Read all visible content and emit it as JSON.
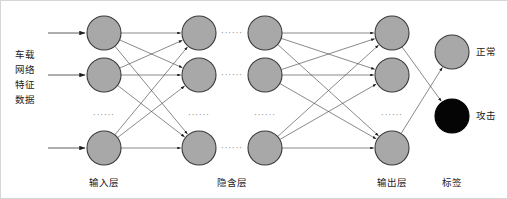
{
  "figure": {
    "type": "neural-network-architecture-diagram",
    "background_color": "#ffffff",
    "border_color": "#cfcfcf"
  },
  "side_label": {
    "name": "input-data-label",
    "lines": [
      "车载",
      "网络",
      "特征",
      "数据"
    ],
    "full_text": "车载网络特征数据",
    "x": 25,
    "y_start": 58
  },
  "layer_labels": [
    {
      "id": "input-layer-label",
      "text": "输入层",
      "x": 104,
      "y": 186
    },
    {
      "id": "hidden-layer-label",
      "text": "隐含层",
      "x": 232,
      "y": 186
    },
    {
      "id": "output-layer-label",
      "text": "输出层",
      "x": 392,
      "y": 186
    },
    {
      "id": "tag-layer-label",
      "text": "标签",
      "x": 452,
      "y": 186
    }
  ],
  "class_labels": [
    {
      "id": "label-normal",
      "text": "正常",
      "x": 476,
      "y": 52,
      "node_fill": "#a8a8a8"
    },
    {
      "id": "label-attack",
      "text": "攻击",
      "x": 476,
      "y": 116,
      "node_fill": "#000000"
    }
  ],
  "node_style": {
    "radius": 17,
    "fill_gray": "#a8a8a8",
    "fill_black": "#050505",
    "stroke": "#3a3a3a",
    "stroke_width": 1.1
  },
  "edge_style": {
    "stroke": "#4a4a4a",
    "stroke_width": 0.65,
    "arrow_color": "#1f1f1f"
  },
  "columns": [
    {
      "id": "col-input",
      "name": "input-layer",
      "x": 104,
      "nodes_y": [
        33,
        75,
        148
      ],
      "fill": "#a8a8a8",
      "ellipsis_y": 115,
      "ellipsis_text": "······"
    },
    {
      "id": "col-hidden-1",
      "name": "hidden-layer-left",
      "x": 199,
      "nodes_y": [
        33,
        75,
        148
      ],
      "fill": "#a8a8a8",
      "ellipsis_y": 115,
      "ellipsis_text": "······"
    },
    {
      "id": "col-hidden-2",
      "name": "hidden-layer-right",
      "x": 265,
      "nodes_y": [
        33,
        75,
        148
      ],
      "fill": "#a8a8a8",
      "ellipsis_y": 115,
      "ellipsis_text": "······"
    },
    {
      "id": "col-output",
      "name": "output-layer",
      "x": 392,
      "nodes_y": [
        33,
        75,
        148
      ],
      "fill": "#a8a8a8",
      "ellipsis_y": 115,
      "ellipsis_text": "······"
    },
    {
      "id": "col-tags",
      "name": "tag-layer",
      "x": 452,
      "nodes_y": [
        52,
        116
      ],
      "fills": [
        "#a8a8a8",
        "#050505"
      ]
    }
  ],
  "inter_column_gap": {
    "id": "hidden-gap-dots",
    "text": "······",
    "rows_y": [
      33,
      75,
      148
    ],
    "x": 232
  },
  "incoming_arrows": {
    "name": "input-feed-arrows",
    "x_start": 48,
    "x_end": 85,
    "rows_y": [
      33,
      75,
      148
    ]
  },
  "connections": [
    {
      "from": "col-input",
      "to": "col-hidden-1",
      "pattern": "fully-connected-3x3"
    },
    {
      "from": "col-hidden-2",
      "to": "col-output",
      "pattern": "fully-connected-3x3"
    },
    {
      "from": "col-output",
      "to": "col-tags",
      "pattern": "output-to-tags"
    }
  ]
}
